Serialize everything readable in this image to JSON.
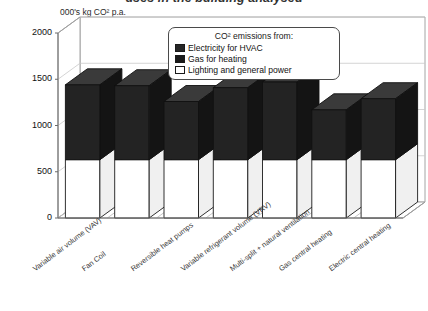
{
  "chart_data": {
    "type": "bar",
    "subtype": "stacked-3d-column",
    "title": "uses in the building analysed",
    "ylabel": "000's kg CO² p.a.",
    "xlabel": "",
    "ylim": [
      0,
      2000
    ],
    "yticks": [
      0,
      500,
      1000,
      1500,
      2000
    ],
    "grid": true,
    "legend_position": "top-center-inside",
    "legend_title": "CO² emissions from:",
    "categories": [
      "Variable air volume (VAV)",
      "Fan Coil",
      "Reversible heat pumps",
      "Variable refrigerant volume (VRV)",
      "Multi-split + natural ventilation",
      "Gas central heating",
      "Electric central heating"
    ],
    "series": [
      {
        "name": "Lighting and general power",
        "color": "#ffffff",
        "values": [
          630,
          630,
          630,
          630,
          630,
          630,
          630
        ]
      },
      {
        "name": "Gas for heating",
        "color": "#1a1a1a",
        "values": [
          0,
          0,
          0,
          0,
          0,
          0,
          0
        ]
      },
      {
        "name": "Electricity for HVAC",
        "color": "#262626",
        "values": [
          810,
          800,
          630,
          780,
          840,
          540,
          660
        ]
      }
    ],
    "totals": [
      1440,
      1430,
      1260,
      1410,
      1470,
      1170,
      1290
    ]
  },
  "legend": {
    "title": "CO² emissions from:",
    "items": [
      {
        "label": "Electricity for HVAC",
        "color": "#262626"
      },
      {
        "label": "Gas for heating",
        "color": "#1a1a1a"
      },
      {
        "label": "Lighting and general power",
        "color": "#ffffff"
      }
    ]
  },
  "axes": {
    "y_caption": "000's kg CO² p.a.",
    "y_ticks": [
      "2000",
      "1500",
      "1000",
      "500",
      "0"
    ]
  },
  "title": "uses in the building analysed"
}
